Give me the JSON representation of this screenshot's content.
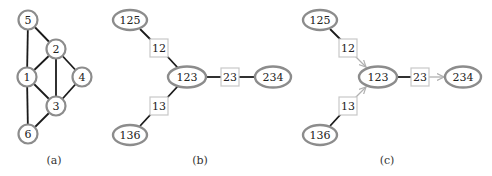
{
  "figure": {
    "panels": [
      {
        "id": "a",
        "caption": "(a)",
        "type": "graph",
        "nodes": [
          {
            "label": "5",
            "x": 28,
            "y": 20
          },
          {
            "label": "2",
            "x": 56,
            "y": 49
          },
          {
            "label": "1",
            "x": 27,
            "y": 77
          },
          {
            "label": "4",
            "x": 82,
            "y": 77
          },
          {
            "label": "3",
            "x": 56,
            "y": 106
          },
          {
            "label": "6",
            "x": 28,
            "y": 134
          }
        ],
        "edges": [
          [
            "5",
            "2"
          ],
          [
            "5",
            "1"
          ],
          [
            "2",
            "1"
          ],
          [
            "2",
            "3"
          ],
          [
            "2",
            "4"
          ],
          [
            "1",
            "3"
          ],
          [
            "1",
            "6"
          ],
          [
            "4",
            "3"
          ],
          [
            "3",
            "6"
          ]
        ]
      },
      {
        "id": "b",
        "caption": "(b)",
        "type": "junction-tree",
        "cliques": [
          {
            "label": "125",
            "x": 130,
            "y": 20
          },
          {
            "label": "123",
            "x": 187,
            "y": 77
          },
          {
            "label": "234",
            "x": 273,
            "y": 77
          },
          {
            "label": "136",
            "x": 130,
            "y": 135
          }
        ],
        "separators": [
          {
            "label": "12",
            "x": 159,
            "y": 48
          },
          {
            "label": "23",
            "x": 230,
            "y": 77
          },
          {
            "label": "13",
            "x": 159,
            "y": 106
          }
        ]
      },
      {
        "id": "c",
        "caption": "(c)",
        "type": "junction-tree-directed",
        "cliques": [
          {
            "label": "125",
            "x": 320,
            "y": 20
          },
          {
            "label": "123",
            "x": 378,
            "y": 77
          },
          {
            "label": "234",
            "x": 463,
            "y": 77
          },
          {
            "label": "136",
            "x": 320,
            "y": 135
          }
        ],
        "separators": [
          {
            "label": "12",
            "x": 348,
            "y": 48
          },
          {
            "label": "23",
            "x": 420,
            "y": 77
          },
          {
            "label": "13",
            "x": 348,
            "y": 106
          }
        ],
        "arrows": [
          [
            "12",
            "123"
          ],
          [
            "13",
            "123"
          ],
          [
            "23",
            "234"
          ]
        ]
      }
    ]
  },
  "a": {
    "n5": "5",
    "n2": "2",
    "n1": "1",
    "n4": "4",
    "n3": "3",
    "n6": "6",
    "caption": "(a)"
  },
  "b": {
    "c125": "125",
    "c123": "123",
    "c234": "234",
    "c136": "136",
    "s12": "12",
    "s23": "23",
    "s13": "13",
    "caption": "(b)"
  },
  "c": {
    "c125": "125",
    "c123": "123",
    "c234": "234",
    "c136": "136",
    "s12": "12",
    "s23": "23",
    "s13": "13",
    "caption": "(c)"
  },
  "colors": {
    "node_stroke": "#8c8c8c",
    "separator_stroke": "#c8c8c8",
    "edge": "#1a1a1a",
    "arrow": "#b0b0b0"
  }
}
